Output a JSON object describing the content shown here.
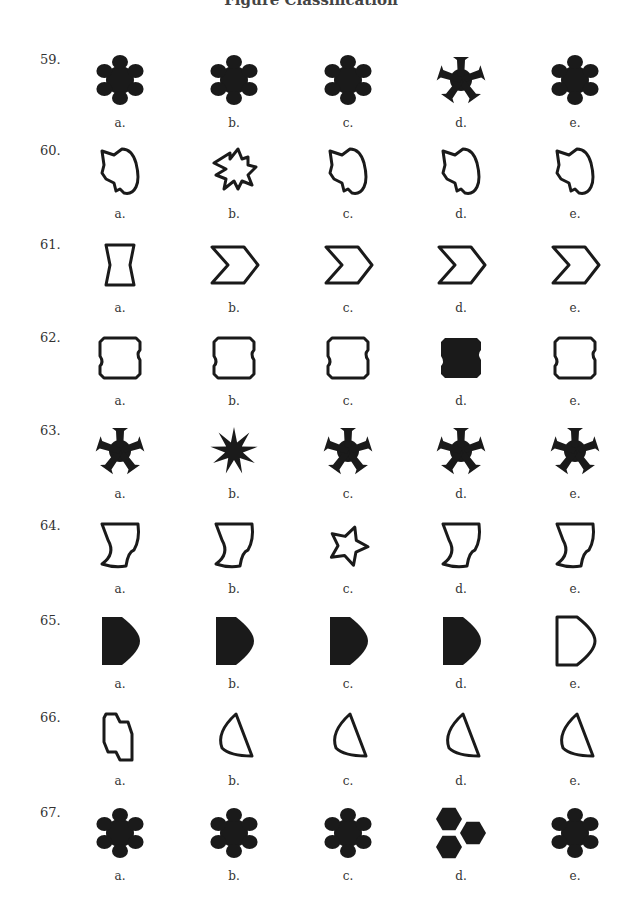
{
  "page": {
    "header_partial": "Figure Classification"
  },
  "questions": [
    {
      "number": "59.",
      "options": [
        {
          "label": "a.",
          "shape": "flower-blob-6",
          "style": "filled"
        },
        {
          "label": "b.",
          "shape": "flower-blob-6",
          "style": "filled"
        },
        {
          "label": "c.",
          "shape": "flower-blob-6",
          "style": "filled"
        },
        {
          "label": "d.",
          "shape": "flared-star-5",
          "style": "filled"
        },
        {
          "label": "e.",
          "shape": "flower-blob-6",
          "style": "filled"
        }
      ]
    },
    {
      "number": "60.",
      "options": [
        {
          "label": "a.",
          "shape": "irregular-blob",
          "style": "outline"
        },
        {
          "label": "b.",
          "shape": "jagged-burst",
          "style": "outline"
        },
        {
          "label": "c.",
          "shape": "irregular-blob",
          "style": "outline"
        },
        {
          "label": "d.",
          "shape": "irregular-blob",
          "style": "outline"
        },
        {
          "label": "e.",
          "shape": "irregular-blob",
          "style": "outline"
        }
      ]
    },
    {
      "number": "61.",
      "options": [
        {
          "label": "a.",
          "shape": "hourglass-rect",
          "style": "outline"
        },
        {
          "label": "b.",
          "shape": "chevron",
          "style": "outline"
        },
        {
          "label": "c.",
          "shape": "chevron",
          "style": "outline"
        },
        {
          "label": "d.",
          "shape": "chevron",
          "style": "outline"
        },
        {
          "label": "e.",
          "shape": "chevron",
          "style": "outline"
        }
      ]
    },
    {
      "number": "62.",
      "options": [
        {
          "label": "a.",
          "shape": "notched-rect",
          "style": "outline"
        },
        {
          "label": "b.",
          "shape": "notched-rect",
          "style": "outline"
        },
        {
          "label": "c.",
          "shape": "notched-rect",
          "style": "outline"
        },
        {
          "label": "d.",
          "shape": "notched-rect",
          "style": "filled"
        },
        {
          "label": "e.",
          "shape": "notched-rect",
          "style": "outline"
        }
      ]
    },
    {
      "number": "63.",
      "options": [
        {
          "label": "a.",
          "shape": "flared-star-5",
          "style": "filled"
        },
        {
          "label": "b.",
          "shape": "spike-star-9",
          "style": "filled"
        },
        {
          "label": "c.",
          "shape": "flared-star-5",
          "style": "filled"
        },
        {
          "label": "d.",
          "shape": "flared-star-5",
          "style": "filled"
        },
        {
          "label": "e.",
          "shape": "flared-star-5",
          "style": "filled"
        }
      ]
    },
    {
      "number": "64.",
      "options": [
        {
          "label": "a.",
          "shape": "curved-quad",
          "style": "outline"
        },
        {
          "label": "b.",
          "shape": "curved-quad",
          "style": "outline"
        },
        {
          "label": "c.",
          "shape": "soft-star-5",
          "style": "outline"
        },
        {
          "label": "d.",
          "shape": "curved-quad",
          "style": "outline"
        },
        {
          "label": "e.",
          "shape": "curved-quad",
          "style": "outline"
        }
      ]
    },
    {
      "number": "65.",
      "options": [
        {
          "label": "a.",
          "shape": "d-shape",
          "style": "filled"
        },
        {
          "label": "b.",
          "shape": "d-shape",
          "style": "filled"
        },
        {
          "label": "c.",
          "shape": "d-shape",
          "style": "filled"
        },
        {
          "label": "d.",
          "shape": "d-shape",
          "style": "filled"
        },
        {
          "label": "e.",
          "shape": "d-shape",
          "style": "outline"
        }
      ]
    },
    {
      "number": "66.",
      "options": [
        {
          "label": "a.",
          "shape": "step-octagon",
          "style": "outline"
        },
        {
          "label": "b.",
          "shape": "curved-triangle",
          "style": "outline"
        },
        {
          "label": "c.",
          "shape": "curved-triangle",
          "style": "outline"
        },
        {
          "label": "d.",
          "shape": "curved-triangle",
          "style": "outline"
        },
        {
          "label": "e.",
          "shape": "curved-triangle",
          "style": "outline"
        }
      ]
    },
    {
      "number": "67.",
      "options": [
        {
          "label": "a.",
          "shape": "flower-blob-6",
          "style": "filled"
        },
        {
          "label": "b.",
          "shape": "flower-blob-6",
          "style": "filled"
        },
        {
          "label": "c.",
          "shape": "flower-blob-6",
          "style": "filled"
        },
        {
          "label": "d.",
          "shape": "three-hexagons",
          "style": "filled"
        },
        {
          "label": "e.",
          "shape": "flower-blob-6",
          "style": "filled"
        }
      ]
    }
  ],
  "layout": {
    "row_tops": [
      52,
      143,
      237,
      330,
      423,
      518,
      613,
      710,
      805
    ],
    "col_lefts": [
      80,
      194,
      308,
      421,
      535
    ]
  },
  "colors": {
    "ink": "#1a1a1a",
    "text": "#333333",
    "background": "#ffffff"
  }
}
